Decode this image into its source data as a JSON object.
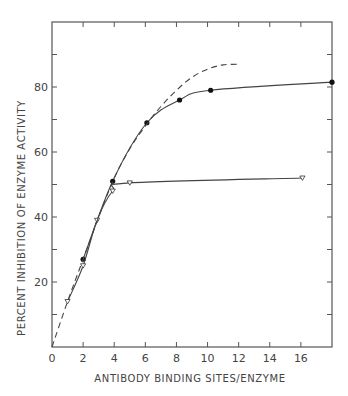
{
  "chart_data": {
    "type": "line",
    "title": "",
    "xlabel": "ANTIBODY BINDING SITES/ENZYME",
    "ylabel": "PERCENT INHIBITION OF ENZYME ACTIVITY",
    "xlim": [
      0,
      18
    ],
    "ylim": [
      0,
      100
    ],
    "x_ticks": [
      0,
      2,
      4,
      6,
      8,
      10,
      12,
      14,
      16
    ],
    "x_tick_labels": [
      "0",
      "2",
      "4",
      "6",
      "8",
      "10",
      "12",
      "14",
      "16"
    ],
    "y_ticks": [
      10,
      20,
      30,
      40,
      50,
      60,
      70,
      80,
      90
    ],
    "y_tick_labels": [
      "",
      "20",
      "",
      "40",
      "",
      "60",
      "",
      "80",
      ""
    ],
    "grid": false,
    "legend": null,
    "series": [
      {
        "name": "filled circles",
        "marker": "filled-circle",
        "line": "solid",
        "points": [
          [
            2.0,
            27
          ],
          [
            3.9,
            51
          ],
          [
            6.1,
            69
          ],
          [
            8.2,
            76
          ],
          [
            10.2,
            79
          ],
          [
            18.0,
            81.5
          ]
        ]
      },
      {
        "name": "open triangles",
        "marker": "open-triangle",
        "line": "solid",
        "points": [
          [
            1.0,
            14
          ],
          [
            2.0,
            25
          ],
          [
            2.9,
            39
          ],
          [
            3.9,
            48
          ],
          [
            5.0,
            50.5
          ],
          [
            16.1,
            52
          ]
        ]
      },
      {
        "name": "theoretical curve",
        "marker": "none",
        "line": "dashed",
        "points": [
          [
            0,
            0
          ],
          [
            1.0,
            14
          ],
          [
            2.0,
            27
          ],
          [
            3.0,
            40
          ],
          [
            4.0,
            52
          ],
          [
            5.0,
            61
          ],
          [
            6.0,
            68
          ],
          [
            7.0,
            74
          ],
          [
            8.0,
            79
          ],
          [
            9.0,
            83
          ],
          [
            10.0,
            85.5
          ],
          [
            11.0,
            86.8
          ],
          [
            12.1,
            87
          ]
        ]
      }
    ]
  }
}
